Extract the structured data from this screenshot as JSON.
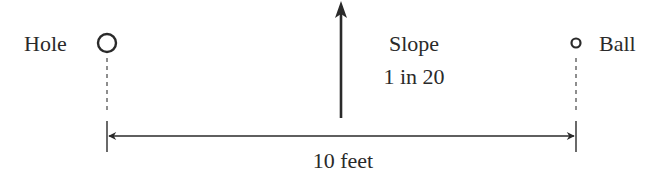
{
  "diagram": {
    "hole": {
      "label": "Hole"
    },
    "ball": {
      "label": "Ball"
    },
    "slope": {
      "title": "Slope",
      "ratio": "1 in 20"
    },
    "distance": {
      "label": "10 feet"
    },
    "colors": {
      "ink": "#2a2a2a",
      "background": "#ffffff"
    }
  }
}
